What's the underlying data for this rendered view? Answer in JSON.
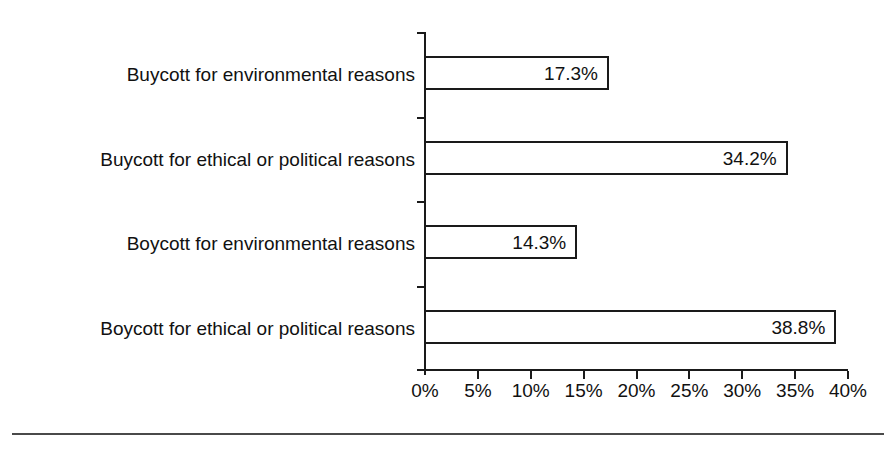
{
  "chart_data": {
    "type": "bar",
    "orientation": "horizontal",
    "title": "",
    "subtitle": "",
    "xlabel": "",
    "ylabel": "",
    "categories": [
      "Buycott for environmental reasons",
      "Buycott for ethical or political reasons",
      "Boycott for environmental reasons",
      "Boycott for ethical or political reasons"
    ],
    "values": [
      17.3,
      34.2,
      14.3,
      38.8
    ],
    "value_labels": [
      "17.3%",
      "34.2%",
      "14.3%",
      "38.8%"
    ],
    "xlim": [
      0,
      40
    ],
    "xticks": [
      0,
      5,
      10,
      15,
      20,
      25,
      30,
      35,
      40
    ],
    "xtick_labels": [
      "0%",
      "5%",
      "10%",
      "15%",
      "20%",
      "25%",
      "30%",
      "35%",
      "40%"
    ],
    "grid": false,
    "legend": null,
    "legend_position": "none",
    "bar_fill_color": "#ffffff",
    "bar_border_color": "#1a1a1a",
    "axis_color": "#1a1a1a",
    "text_color": "#111111",
    "background_color": "#ffffff",
    "rule_color": "#4a4a4a"
  }
}
